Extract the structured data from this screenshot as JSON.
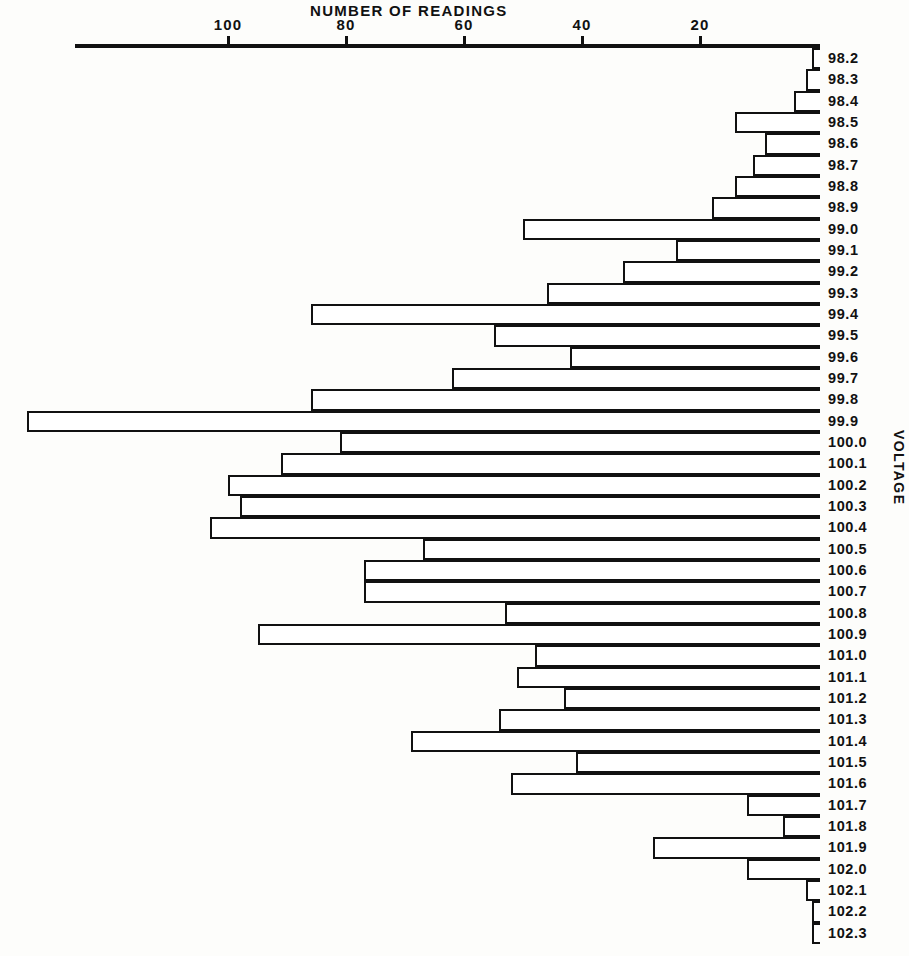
{
  "chart_data": {
    "type": "bar",
    "orientation": "horizontal",
    "title": "NUMBER OF READINGS",
    "xlabel": "NUMBER OF READINGS",
    "ylabel": "VOLTAGE",
    "xlim": [
      140,
      0
    ],
    "x_axis_position": "top",
    "x_axis_reversed": true,
    "xticks": [
      100,
      80,
      60,
      40,
      20
    ],
    "xtick_labels": [
      "100",
      "80",
      "60",
      "40",
      "20"
    ],
    "grid": false,
    "legend": null,
    "categories": [
      "98.2",
      "98.3",
      "98.4",
      "98.5",
      "98.6",
      "98.7",
      "98.8",
      "98.9",
      "99.0",
      "99.1",
      "99.2",
      "99.3",
      "99.4",
      "99.5",
      "99.6",
      "99.7",
      "99.8",
      "99.9",
      "100.0",
      "100.1",
      "100.2",
      "100.3",
      "100.4",
      "100.5",
      "100.6",
      "100.7",
      "100.8",
      "100.9",
      "101.0",
      "101.1",
      "101.2",
      "101.3",
      "101.4",
      "101.5",
      "101.6",
      "101.7",
      "101.8",
      "101.9",
      "102.0",
      "102.1",
      "102.2",
      "102.3"
    ],
    "values": [
      1,
      2,
      4,
      14,
      9,
      11,
      14,
      18,
      50,
      24,
      33,
      46,
      86,
      55,
      42,
      62,
      86,
      134,
      81,
      91,
      100,
      98,
      103,
      67,
      77,
      77,
      53,
      95,
      48,
      51,
      43,
      54,
      69,
      41,
      52,
      12,
      6,
      28,
      12,
      2,
      1,
      1
    ]
  },
  "axis": {
    "title": "NUMBER OF READINGS",
    "y_title": "VOLTAGE"
  }
}
